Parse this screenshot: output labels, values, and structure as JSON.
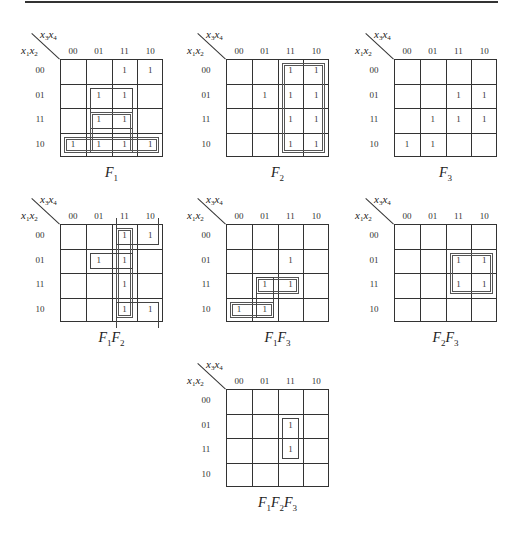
{
  "axis": {
    "row_var": [
      "x",
      "1",
      "x",
      "2"
    ],
    "col_var": [
      "x",
      "3",
      "x",
      "4"
    ],
    "cols": [
      "00",
      "01",
      "11",
      "10"
    ],
    "rows": [
      "00",
      "01",
      "11",
      "10"
    ]
  },
  "cell_value": "1",
  "maps": [
    {
      "id": "F1",
      "caption": [
        [
          "F",
          "1"
        ]
      ],
      "origin": [
        60,
        59
      ],
      "ones": [
        [
          0,
          2
        ],
        [
          0,
          3
        ],
        [
          1,
          1
        ],
        [
          1,
          2
        ],
        [
          2,
          1
        ],
        [
          2,
          2
        ],
        [
          3,
          0
        ],
        [
          3,
          1
        ],
        [
          3,
          2
        ],
        [
          3,
          3
        ]
      ],
      "groups": [
        {
          "r0": 1,
          "c0": 1,
          "r1": 2,
          "c1": 2,
          "style": "single"
        },
        {
          "r0": 2,
          "c0": 1,
          "r1": 3,
          "c1": 2,
          "style": "double"
        },
        {
          "r0": 3,
          "c0": 0,
          "r1": 3,
          "c1": 3,
          "style": "double"
        }
      ]
    },
    {
      "id": "F2",
      "caption": [
        [
          "F",
          "2"
        ]
      ],
      "origin": [
        226,
        59
      ],
      "ones": [
        [
          0,
          2
        ],
        [
          0,
          3
        ],
        [
          1,
          1
        ],
        [
          1,
          2
        ],
        [
          1,
          3
        ],
        [
          2,
          2
        ],
        [
          2,
          3
        ],
        [
          3,
          2
        ],
        [
          3,
          3
        ]
      ],
      "groups": [
        {
          "r0": 0,
          "c0": 2,
          "r1": 3,
          "c1": 3,
          "style": "double"
        }
      ]
    },
    {
      "id": "F3",
      "caption": [
        [
          "F",
          "3"
        ]
      ],
      "origin": [
        394,
        59
      ],
      "ones": [
        [
          1,
          2
        ],
        [
          1,
          3
        ],
        [
          2,
          1
        ],
        [
          2,
          2
        ],
        [
          2,
          3
        ],
        [
          3,
          0
        ],
        [
          3,
          1
        ]
      ],
      "groups": []
    },
    {
      "id": "F1F2",
      "caption": [
        [
          "F",
          "1"
        ],
        [
          "F",
          "2"
        ]
      ],
      "origin": [
        60,
        224
      ],
      "ones": [
        [
          0,
          2
        ],
        [
          0,
          3
        ],
        [
          1,
          1
        ],
        [
          1,
          2
        ],
        [
          2,
          2
        ],
        [
          3,
          2
        ],
        [
          3,
          3
        ]
      ],
      "groups": [
        {
          "r0": 0,
          "c0": 2,
          "r1": 3,
          "c1": 2,
          "style": "double"
        },
        {
          "r0": 1,
          "c0": 1,
          "r1": 1,
          "c1": 2,
          "style": "single"
        },
        {
          "r0": 0,
          "c0": 2,
          "r1": 0,
          "c1": 3,
          "style": "single",
          "open": "top"
        },
        {
          "r0": 3,
          "c0": 2,
          "r1": 3,
          "c1": 3,
          "style": "single",
          "open": "bottom"
        }
      ]
    },
    {
      "id": "F1F3",
      "caption": [
        [
          "F",
          "1"
        ],
        [
          "F",
          "3"
        ]
      ],
      "origin": [
        226,
        224
      ],
      "ones": [
        [
          1,
          2
        ],
        [
          2,
          1
        ],
        [
          2,
          2
        ],
        [
          3,
          0
        ],
        [
          3,
          1
        ]
      ],
      "groups": [
        {
          "r0": 2,
          "c0": 1,
          "r1": 2,
          "c1": 2,
          "style": "double"
        },
        {
          "r0": 3,
          "c0": 0,
          "r1": 3,
          "c1": 1,
          "style": "double"
        },
        {
          "r0": 2,
          "c0": 1,
          "r1": 3,
          "c1": 1,
          "style": "single"
        }
      ]
    },
    {
      "id": "F2F3",
      "caption": [
        [
          "F",
          "2"
        ],
        [
          "F",
          "3"
        ]
      ],
      "origin": [
        394,
        224
      ],
      "ones": [
        [
          1,
          2
        ],
        [
          1,
          3
        ],
        [
          2,
          2
        ],
        [
          2,
          3
        ]
      ],
      "groups": [
        {
          "r0": 1,
          "c0": 2,
          "r1": 2,
          "c1": 3,
          "style": "double"
        }
      ]
    },
    {
      "id": "F1F2F3",
      "caption": [
        [
          "F",
          "1"
        ],
        [
          "F",
          "2"
        ],
        [
          "F",
          "3"
        ]
      ],
      "origin": [
        226,
        389
      ],
      "ones": [
        [
          1,
          2
        ],
        [
          2,
          2
        ]
      ],
      "groups": [
        {
          "r0": 1,
          "c0": 2,
          "r1": 2,
          "c1": 2,
          "style": "single"
        }
      ]
    }
  ]
}
